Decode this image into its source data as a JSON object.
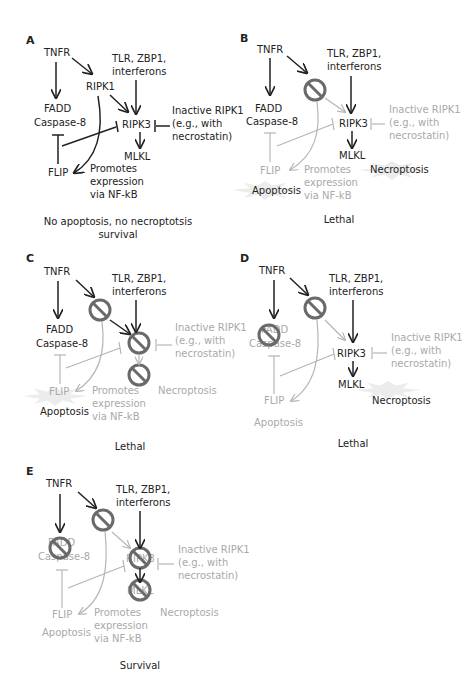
{
  "figure": {
    "nodes": {
      "tnfr": "TNFR",
      "tlr_line1": "TLR, ZBP1,",
      "tlr_line2": "interferons",
      "ripk1": "RIPK1",
      "fadd": "FADD",
      "caspase8": "Caspase-8",
      "ripk3": "RIPK3",
      "inactive_line1": "Inactive RIPK1",
      "inactive_line2": "(e.g., with",
      "inactive_line3": "necrostatin)",
      "mlkl": "MLKL",
      "flip": "FLIP",
      "promotes_line1": "Promotes",
      "promotes_line2": "expression",
      "promotes_line3": "via NF-kB",
      "apoptosis": "Apoptosis",
      "necroptosis": "Necroptosis"
    },
    "panels": [
      {
        "id": "A",
        "caption_line1": "No apoptosis, no necroptotsis",
        "caption_line2": "survival",
        "blocked": [],
        "active_outcomes": []
      },
      {
        "id": "B",
        "caption_line1": "Lethal",
        "blocked": [
          "RIPK1"
        ],
        "active_outcomes": [
          "Apoptosis",
          "Necroptosis"
        ]
      },
      {
        "id": "C",
        "caption_line1": "Lethal",
        "blocked": [
          "RIPK1",
          "RIPK3",
          "MLKL"
        ],
        "active_outcomes": [
          "Apoptosis"
        ]
      },
      {
        "id": "D",
        "caption_line1": "Lethal",
        "blocked": [
          "RIPK1",
          "FADD/Caspase-8"
        ],
        "active_outcomes": [
          "Necroptosis"
        ]
      },
      {
        "id": "E",
        "caption_line1": "Survival",
        "blocked": [
          "RIPK1",
          "FADD/Caspase-8",
          "RIPK3",
          "MLKL"
        ],
        "active_outcomes": []
      }
    ],
    "colors": {
      "active": "#222222",
      "inactive": "#a9a9a9",
      "ban_symbol": "#6a6a6a"
    }
  }
}
